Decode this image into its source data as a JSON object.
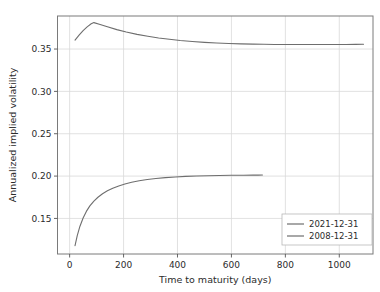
{
  "chart_data": {
    "type": "line",
    "title": "",
    "subtitle": "",
    "xlabel": "Time to maturity (days)",
    "ylabel": "Annualized implied volatility",
    "xlim": [
      -45,
      1125
    ],
    "ylim": [
      0.108,
      0.389
    ],
    "xticks": [
      0,
      200,
      400,
      600,
      800,
      1000
    ],
    "xticklabels": [
      "0",
      "200",
      "400",
      "600",
      "800",
      "1000"
    ],
    "yticks": [
      0.15,
      0.2,
      0.25,
      0.3,
      0.35
    ],
    "yticklabels": [
      "0.15",
      "0.20",
      "0.25",
      "0.30",
      "0.35"
    ],
    "grid": true,
    "grid_color": "#d9d9d9",
    "legend_position": "lower right",
    "series": [
      {
        "name": "2021-12-31",
        "color": "#6e6e6e",
        "x": [
          20,
          35,
          50,
          65,
          80,
          90,
          110,
          140,
          175,
          210,
          250,
          290,
          330,
          370,
          410,
          455,
          500,
          545,
          590,
          635,
          680,
          720,
          760,
          800,
          845,
          890,
          935,
          980,
          1025,
          1060,
          1090
        ],
        "values": [
          0.3605,
          0.3665,
          0.3718,
          0.3762,
          0.3798,
          0.3812,
          0.3792,
          0.3762,
          0.3729,
          0.3701,
          0.3673,
          0.3651,
          0.3631,
          0.3615,
          0.3601,
          0.3589,
          0.3579,
          0.3572,
          0.3566,
          0.3561,
          0.3558,
          0.3556,
          0.3554,
          0.3553,
          0.3553,
          0.3553,
          0.3553,
          0.3554,
          0.3554,
          0.3555,
          0.3556
        ]
      },
      {
        "name": "2008-12-31",
        "color": "#6e6e6e",
        "x": [
          20,
          28,
          38,
          50,
          62,
          75,
          90,
          105,
          122,
          140,
          160,
          182,
          205,
          230,
          258,
          288,
          320,
          355,
          392,
          430,
          470,
          512,
          555,
          600,
          645,
          680,
          700,
          715
        ],
        "values": [
          0.1178,
          0.1295,
          0.1405,
          0.1505,
          0.1583,
          0.1648,
          0.1705,
          0.175,
          0.1791,
          0.1826,
          0.1857,
          0.1884,
          0.1907,
          0.1927,
          0.1945,
          0.196,
          0.1972,
          0.1982,
          0.199,
          0.1996,
          0.2001,
          0.2004,
          0.2007,
          0.2009,
          0.201,
          0.2011,
          0.2011,
          0.2012
        ]
      }
    ]
  }
}
